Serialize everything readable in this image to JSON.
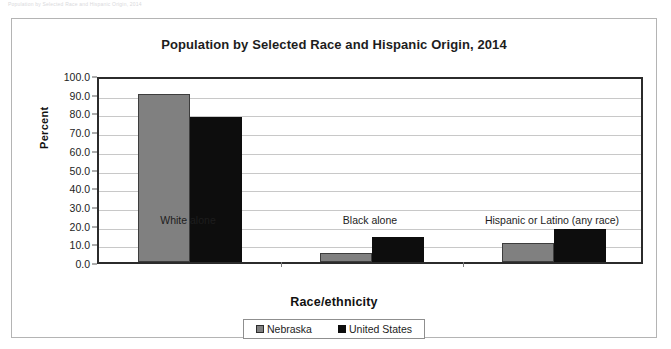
{
  "page": {
    "top_note": "Population by Selected Race and Hispanic Origin, 2014"
  },
  "chart_data": {
    "type": "bar",
    "title": "Population by Selected Race and Hispanic Origin, 2014",
    "xlabel": "Race/ethnicity",
    "ylabel": "Percent",
    "categories": [
      "White alone",
      "Black alone",
      "Hispanic or Latino (any race)"
    ],
    "series": [
      {
        "name": "Nebraska",
        "color": "#808080",
        "values": [
          90.0,
          4.9,
          10.4
        ]
      },
      {
        "name": "United States",
        "color": "#0d0d0d",
        "values": [
          77.4,
          13.2,
          17.4
        ]
      }
    ],
    "ylim": [
      0.0,
      100.0
    ],
    "ytick_step": 10.0,
    "ytick_labels": [
      "100.0",
      "90.0",
      "80.0",
      "70.0",
      "60.0",
      "50.0",
      "40.0",
      "30.0",
      "20.0",
      "10.0",
      "0.0"
    ],
    "ytick_values": [
      100.0,
      90.0,
      80.0,
      70.0,
      60.0,
      50.0,
      40.0,
      30.0,
      20.0,
      10.0,
      0.0
    ],
    "grid": true,
    "legend_position": "bottom",
    "legend": [
      "Nebraska",
      "United States"
    ]
  }
}
